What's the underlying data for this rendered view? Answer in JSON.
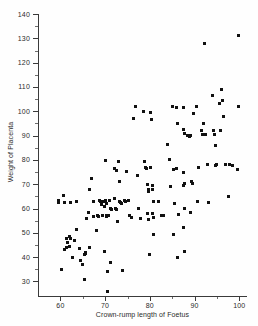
{
  "chart_data": {
    "type": "scatter",
    "title": "",
    "xlabel": "Crown-rump length of Foetus",
    "ylabel": "Weight of Placenta",
    "xlim": [
      55,
      101.5
    ],
    "ylim": [
      24,
      140
    ],
    "grid": false,
    "legend": null,
    "xticks": [
      60,
      70,
      80,
      90,
      100
    ],
    "xtick_labels": [
      "60",
      "70",
      "80",
      "90",
      "100"
    ],
    "xticks_minor": [
      65,
      75,
      85,
      95
    ],
    "yticks": [
      30,
      40,
      50,
      60,
      70,
      80,
      90,
      100,
      110,
      120,
      130,
      140
    ],
    "ytick_labels": [
      "30",
      "40",
      "50",
      "60",
      "70",
      "80",
      "90",
      "100",
      "110",
      "120",
      "130",
      "140"
    ],
    "yticks_minor": [
      35,
      45,
      55,
      65,
      75,
      85,
      95,
      105,
      115,
      125,
      135
    ],
    "marker": "square",
    "marker_color": "#111111",
    "points": [
      [
        59.6,
        63.5
      ],
      [
        59.6,
        62.3
      ],
      [
        60.6,
        65.5
      ],
      [
        60.3,
        34.8
      ],
      [
        61.0,
        62.5
      ],
      [
        61.3,
        47.5
      ],
      [
        61.5,
        46.0
      ],
      [
        61.3,
        44.0
      ],
      [
        61.0,
        43.3
      ],
      [
        62.0,
        48.3
      ],
      [
        62.2,
        47.5
      ],
      [
        62.3,
        62.5
      ],
      [
        62.0,
        44.5
      ],
      [
        62.6,
        39.7
      ],
      [
        63.2,
        47.0
      ],
      [
        63.5,
        62.8
      ],
      [
        63.6,
        51.5
      ],
      [
        64.2,
        43.5
      ],
      [
        64.5,
        38.6
      ],
      [
        64.9,
        37.0
      ],
      [
        65.3,
        41.0
      ],
      [
        65.5,
        42.0
      ],
      [
        65.6,
        41.3
      ],
      [
        65.4,
        30.8
      ],
      [
        65.8,
        55.8
      ],
      [
        66.2,
        58.5
      ],
      [
        66.5,
        68.0
      ],
      [
        66.9,
        72.5
      ],
      [
        66.6,
        44.0
      ],
      [
        67.3,
        63.0
      ],
      [
        67.5,
        56.8
      ],
      [
        68.0,
        50.8
      ],
      [
        68.3,
        57.0
      ],
      [
        68.6,
        56.8
      ],
      [
        68.8,
        63.5
      ],
      [
        69.0,
        63.0
      ],
      [
        69.2,
        61.5
      ],
      [
        69.3,
        57.2
      ],
      [
        69.5,
        57.0
      ],
      [
        69.7,
        62.8
      ],
      [
        69.8,
        61.0
      ],
      [
        69.9,
        42.5
      ],
      [
        70.0,
        79.7
      ],
      [
        70.1,
        63.5
      ],
      [
        70.2,
        62.0
      ],
      [
        70.3,
        57.0
      ],
      [
        70.4,
        56.8
      ],
      [
        70.5,
        57.2
      ],
      [
        70.8,
        57.0
      ],
      [
        70.6,
        34.0
      ],
      [
        70.5,
        25.8
      ],
      [
        71.0,
        63.3
      ],
      [
        71.2,
        60.0
      ],
      [
        71.5,
        59.8
      ],
      [
        71.3,
        37.8
      ],
      [
        72.0,
        64.0
      ],
      [
        72.2,
        76.5
      ],
      [
        72.5,
        75.5
      ],
      [
        72.4,
        60.0
      ],
      [
        72.6,
        59.8
      ],
      [
        72.8,
        54.5
      ],
      [
        73.0,
        79.5
      ],
      [
        73.2,
        71.0
      ],
      [
        73.3,
        62.8
      ],
      [
        73.5,
        62.5
      ],
      [
        73.6,
        62.0
      ],
      [
        73.8,
        34.5
      ],
      [
        74.3,
        63.5
      ],
      [
        74.5,
        63.0
      ],
      [
        74.8,
        75.2
      ],
      [
        75.2,
        63.2
      ],
      [
        75.5,
        57.0
      ],
      [
        76.0,
        56.2
      ],
      [
        76.3,
        97.0
      ],
      [
        76.8,
        101.8
      ],
      [
        77.2,
        73.5
      ],
      [
        77.5,
        60.0
      ],
      [
        78.0,
        56.0
      ],
      [
        78.5,
        100.0
      ],
      [
        78.8,
        79.5
      ],
      [
        79.0,
        77.0
      ],
      [
        79.2,
        76.5
      ],
      [
        79.4,
        70.0
      ],
      [
        79.6,
        68.0
      ],
      [
        79.8,
        67.0
      ],
      [
        79.5,
        58.0
      ],
      [
        79.7,
        55.5
      ],
      [
        79.9,
        41.0
      ],
      [
        80.2,
        99.7
      ],
      [
        80.4,
        96.5
      ],
      [
        80.2,
        77.0
      ],
      [
        80.5,
        69.5
      ],
      [
        80.6,
        67.8
      ],
      [
        80.8,
        63.0
      ],
      [
        80.5,
        58.0
      ],
      [
        80.7,
        56.5
      ],
      [
        80.9,
        49.2
      ],
      [
        82.0,
        62.8
      ],
      [
        82.5,
        57.0
      ],
      [
        83.0,
        57.0
      ],
      [
        84.0,
        86.5
      ],
      [
        84.3,
        80.0
      ],
      [
        84.5,
        69.0
      ],
      [
        85.0,
        101.8
      ],
      [
        85.3,
        76.0
      ],
      [
        85.6,
        62.0
      ],
      [
        85.3,
        49.5
      ],
      [
        86.0,
        101.5
      ],
      [
        86.2,
        95.0
      ],
      [
        86.0,
        76.5
      ],
      [
        86.3,
        57.5
      ],
      [
        86.1,
        40.0
      ],
      [
        87.5,
        101.5
      ],
      [
        87.6,
        92.5
      ],
      [
        87.8,
        91.0
      ],
      [
        87.5,
        75.0
      ],
      [
        87.7,
        70.5
      ],
      [
        87.6,
        69.5
      ],
      [
        87.8,
        60.0
      ],
      [
        87.5,
        52.0
      ],
      [
        87.7,
        42.5
      ],
      [
        88.5,
        90.0
      ],
      [
        88.8,
        89.8
      ],
      [
        89.0,
        90.0
      ],
      [
        89.3,
        71.0
      ],
      [
        89.5,
        70.2
      ],
      [
        89.1,
        58.5
      ],
      [
        89.8,
        99.0
      ],
      [
        90.5,
        101.8
      ],
      [
        90.8,
        77.0
      ],
      [
        90.6,
        63.0
      ],
      [
        91.5,
        92.0
      ],
      [
        91.8,
        90.5
      ],
      [
        92.0,
        95.0
      ],
      [
        92.3,
        128.0
      ],
      [
        92.5,
        90.5
      ],
      [
        92.8,
        78.0
      ],
      [
        93.0,
        62.5
      ],
      [
        94.0,
        106.5
      ],
      [
        94.3,
        92.0
      ],
      [
        94.5,
        90.5
      ],
      [
        94.7,
        86.0
      ],
      [
        94.8,
        78.0
      ],
      [
        94.6,
        77.5
      ],
      [
        95.5,
        103.0
      ],
      [
        95.8,
        92.0
      ],
      [
        96.0,
        109.0
      ],
      [
        96.3,
        104.5
      ],
      [
        96.5,
        98.0
      ],
      [
        96.8,
        78.0
      ],
      [
        97.5,
        65.0
      ],
      [
        97.8,
        78.0
      ],
      [
        99.8,
        131.0
      ],
      [
        99.9,
        101.8
      ],
      [
        99.7,
        76.0
      ],
      [
        98.5,
        77.5
      ]
    ]
  }
}
